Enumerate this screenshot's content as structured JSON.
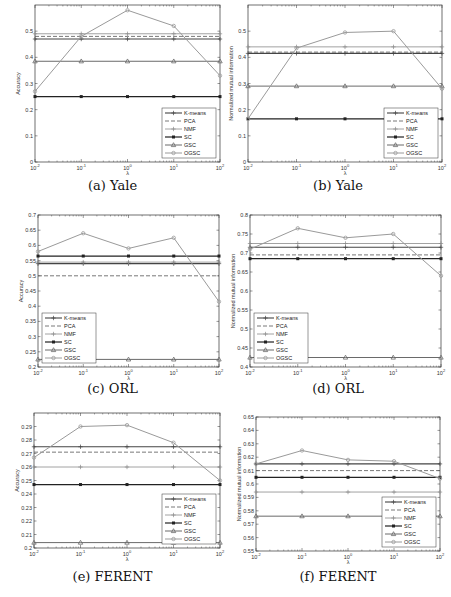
{
  "chart_data": [
    {
      "id": "a",
      "type": "line",
      "caption": "(a) Yale",
      "xlabel": "λ",
      "ylabel": "Accuracy",
      "x": [
        -2,
        -1,
        0,
        1,
        2
      ],
      "xtick_labels": [
        "10^-2",
        "10^-1",
        "10^0",
        "10^1",
        "10^2"
      ],
      "ylim": [
        0,
        0.6
      ],
      "yticks": [
        0,
        0.1,
        0.2,
        0.3,
        0.4,
        0.5
      ],
      "ytick_labels": [
        "0",
        "0.1",
        "0.2",
        "0.3",
        "0.4",
        "0.5"
      ],
      "legend_position": "lower right",
      "grid": false,
      "series": [
        {
          "name": "K-means",
          "values": [
            0.47,
            0.47,
            0.47,
            0.47,
            0.47
          ]
        },
        {
          "name": "PCA",
          "values": [
            0.48,
            0.48,
            0.48,
            0.48,
            0.48
          ]
        },
        {
          "name": "NMF",
          "values": [
            0.49,
            0.49,
            0.49,
            0.49,
            0.49
          ]
        },
        {
          "name": "SC",
          "values": [
            0.25,
            0.25,
            0.25,
            0.25,
            0.25
          ]
        },
        {
          "name": "GSC",
          "values": [
            0.385,
            0.385,
            0.385,
            0.385,
            0.385
          ]
        },
        {
          "name": "OGSC",
          "values": [
            0.27,
            0.48,
            0.58,
            0.52,
            0.33
          ]
        }
      ]
    },
    {
      "id": "b",
      "type": "line",
      "caption": "(b) Yale",
      "xlabel": "λ",
      "ylabel": "Normalized mutual information",
      "x": [
        -2,
        -1,
        0,
        1,
        2
      ],
      "xtick_labels": [
        "10^-2",
        "10^-1",
        "10^0",
        "10^1",
        "10^2"
      ],
      "ylim": [
        0,
        0.6
      ],
      "yticks": [
        0,
        0.1,
        0.2,
        0.3,
        0.4,
        0.5
      ],
      "ytick_labels": [
        "0",
        "0.1",
        "0.2",
        "0.3",
        "0.4",
        "0.5"
      ],
      "legend_position": "lower right",
      "grid": false,
      "series": [
        {
          "name": "K-means",
          "values": [
            0.415,
            0.415,
            0.415,
            0.415,
            0.415
          ]
        },
        {
          "name": "PCA",
          "values": [
            0.42,
            0.42,
            0.42,
            0.42,
            0.42
          ]
        },
        {
          "name": "NMF",
          "values": [
            0.44,
            0.44,
            0.44,
            0.44,
            0.44
          ]
        },
        {
          "name": "SC",
          "values": [
            0.165,
            0.165,
            0.165,
            0.165,
            0.165
          ]
        },
        {
          "name": "GSC",
          "values": [
            0.29,
            0.29,
            0.29,
            0.29,
            0.29
          ]
        },
        {
          "name": "OGSC",
          "values": [
            0.165,
            0.435,
            0.495,
            0.5,
            0.28
          ]
        }
      ]
    },
    {
      "id": "c",
      "type": "line",
      "caption": "(c) ORL",
      "xlabel": "λ",
      "ylabel": "Accuracy",
      "x": [
        -2,
        -1,
        0,
        1,
        2
      ],
      "xtick_labels": [
        "10^-2",
        "10^-1",
        "10^0",
        "10^1",
        "10^2"
      ],
      "ylim": [
        0.2,
        0.7
      ],
      "yticks": [
        0.2,
        0.25,
        0.3,
        0.35,
        0.4,
        0.45,
        0.5,
        0.55,
        0.6,
        0.65,
        0.7
      ],
      "ytick_labels": [
        "0.2",
        "0.25",
        "0.3",
        "0.35",
        "0.4",
        "0.45",
        "0.5",
        "0.55",
        "0.6",
        "0.65",
        "0.7"
      ],
      "legend_position": "lower left",
      "grid": false,
      "series": [
        {
          "name": "K-means",
          "values": [
            0.54,
            0.54,
            0.54,
            0.54,
            0.54
          ]
        },
        {
          "name": "PCA",
          "values": [
            0.5,
            0.5,
            0.5,
            0.5,
            0.5
          ]
        },
        {
          "name": "NMF",
          "values": [
            0.545,
            0.545,
            0.545,
            0.545,
            0.545
          ]
        },
        {
          "name": "SC",
          "values": [
            0.565,
            0.565,
            0.565,
            0.565,
            0.565
          ]
        },
        {
          "name": "GSC",
          "values": [
            0.225,
            0.225,
            0.225,
            0.225,
            0.225
          ]
        },
        {
          "name": "OGSC",
          "values": [
            0.58,
            0.64,
            0.59,
            0.625,
            0.415
          ]
        }
      ]
    },
    {
      "id": "d",
      "type": "line",
      "caption": "(d) ORL",
      "xlabel": "λ",
      "ylabel": "Normalized mutual information",
      "x": [
        -2,
        -1,
        0,
        1,
        2
      ],
      "xtick_labels": [
        "10^-2",
        "10^-1",
        "10^0",
        "10^1",
        "10^2"
      ],
      "ylim": [
        0.4,
        0.8
      ],
      "yticks": [
        0.4,
        0.45,
        0.5,
        0.55,
        0.6,
        0.65,
        0.7,
        0.75,
        0.8
      ],
      "ytick_labels": [
        "0.4",
        "0.45",
        "0.5",
        "0.55",
        "0.6",
        "0.65",
        "0.7",
        "0.75",
        "0.8"
      ],
      "legend_position": "lower left",
      "grid": false,
      "series": [
        {
          "name": "K-means",
          "values": [
            0.715,
            0.715,
            0.715,
            0.715,
            0.715
          ]
        },
        {
          "name": "PCA",
          "values": [
            0.695,
            0.695,
            0.695,
            0.695,
            0.695
          ]
        },
        {
          "name": "NMF",
          "values": [
            0.725,
            0.725,
            0.725,
            0.725,
            0.725
          ]
        },
        {
          "name": "SC",
          "values": [
            0.685,
            0.685,
            0.685,
            0.685,
            0.685
          ]
        },
        {
          "name": "GSC",
          "values": [
            0.425,
            0.425,
            0.425,
            0.425,
            0.425
          ]
        },
        {
          "name": "OGSC",
          "values": [
            0.71,
            0.765,
            0.74,
            0.75,
            0.64
          ]
        }
      ]
    },
    {
      "id": "e",
      "type": "line",
      "caption": "(e) FERENT",
      "xlabel": "λ",
      "ylabel": "Accuracy",
      "x": [
        -2,
        -1,
        0,
        1,
        2
      ],
      "xtick_labels": [
        "10^-2",
        "10^-1",
        "10^0",
        "10^1",
        "10^2"
      ],
      "ylim": [
        0.2,
        0.3
      ],
      "yticks": [
        0.2,
        0.21,
        0.22,
        0.23,
        0.24,
        0.25,
        0.26,
        0.27,
        0.28,
        0.29
      ],
      "ytick_labels": [
        "0.2",
        "0.21",
        "0.22",
        "0.23",
        "0.24",
        "0.25",
        "0.26",
        "0.27",
        "0.28",
        "0.29"
      ],
      "legend_position": "lower right",
      "grid": false,
      "series": [
        {
          "name": "K-means",
          "values": [
            0.275,
            0.275,
            0.275,
            0.275,
            0.275
          ]
        },
        {
          "name": "PCA",
          "values": [
            0.271,
            0.271,
            0.271,
            0.271,
            0.271
          ]
        },
        {
          "name": "NMF",
          "values": [
            0.26,
            0.26,
            0.26,
            0.26,
            0.26
          ]
        },
        {
          "name": "SC",
          "values": [
            0.247,
            0.247,
            0.247,
            0.247,
            0.247
          ]
        },
        {
          "name": "GSC",
          "values": [
            0.204,
            0.204,
            0.204,
            0.204,
            0.204
          ]
        },
        {
          "name": "OGSC",
          "values": [
            0.267,
            0.29,
            0.291,
            0.278,
            0.25
          ]
        }
      ]
    },
    {
      "id": "f",
      "type": "line",
      "caption": "(f) FERENT",
      "xlabel": "λ",
      "ylabel": "Normalized mutual information",
      "x": [
        -2,
        -1,
        0,
        1,
        2
      ],
      "xtick_labels": [
        "10^-2",
        "10^-1",
        "10^0",
        "10^1",
        "10^2"
      ],
      "ylim": [
        0.55,
        0.65
      ],
      "yticks": [
        0.55,
        0.56,
        0.57,
        0.58,
        0.59,
        0.6,
        0.61,
        0.62,
        0.63,
        0.64,
        0.65
      ],
      "ytick_labels": [
        "0.55",
        "0.56",
        "0.57",
        "0.58",
        "0.59",
        "0.6",
        "0.61",
        "0.62",
        "0.63",
        "0.64",
        "0.65"
      ],
      "legend_position": "lower right",
      "grid": false,
      "series": [
        {
          "name": "K-means",
          "values": [
            0.615,
            0.615,
            0.615,
            0.615,
            0.615
          ]
        },
        {
          "name": "PCA",
          "values": [
            0.61,
            0.61,
            0.61,
            0.61,
            0.61
          ]
        },
        {
          "name": "NMF",
          "values": [
            0.594,
            0.594,
            0.594,
            0.594,
            0.594
          ]
        },
        {
          "name": "SC",
          "values": [
            0.605,
            0.605,
            0.605,
            0.605,
            0.605
          ]
        },
        {
          "name": "GSC",
          "values": [
            0.576,
            0.576,
            0.576,
            0.576,
            0.576
          ]
        },
        {
          "name": "OGSC",
          "values": [
            0.615,
            0.625,
            0.618,
            0.617,
            0.604
          ]
        }
      ]
    }
  ],
  "styles": {
    "K-means": {
      "color": "#444444",
      "width": 1.1,
      "dash": "",
      "marker": "plus"
    },
    "PCA": {
      "color": "#555555",
      "width": 0.8,
      "dash": "4,2",
      "marker": "none"
    },
    "NMF": {
      "color": "#8a8a8a",
      "width": 0.8,
      "dash": "",
      "marker": "plus"
    },
    "SC": {
      "color": "#222222",
      "width": 1.2,
      "dash": "",
      "marker": "square"
    },
    "GSC": {
      "color": "#6a6a6a",
      "width": 1.0,
      "dash": "",
      "marker": "triangle"
    },
    "OGSC": {
      "color": "#9a9a9a",
      "width": 1.0,
      "dash": "",
      "marker": "circle"
    }
  }
}
